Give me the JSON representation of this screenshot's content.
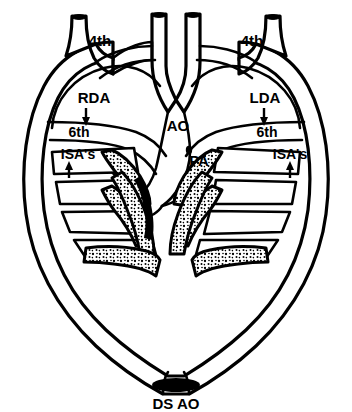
{
  "figure": {
    "background_color": "#ffffff",
    "line_color": "#000000",
    "stipple_fill_color": "#ffffff"
  },
  "labels": {
    "fourth_arch_left": "4th",
    "fourth_arch_right": "4th",
    "right_dorsal_aorta": "RDA",
    "left_dorsal_aorta": "LDA",
    "sixth_arch_left": "6th",
    "sixth_arch_right": "6th",
    "intersegmental_arteries_left": "ISA's",
    "intersegmental_arteries_right": "ISA's",
    "aorta": "AO",
    "pulmonary_artery": "PA",
    "descending_aorta": "DS AO"
  },
  "annotations": {
    "rda_arrow": "down-arrow",
    "lda_arrow": "down-arrow",
    "isa_left_arrow": "up-arrow",
    "isa_right_arrow": "up-arrow"
  },
  "structures": {
    "left_arch_label": "4th",
    "right_arch_label": "4th",
    "vessel_stump_count": 4,
    "isa_band_count_left": 4,
    "isa_band_count_right": 4
  }
}
